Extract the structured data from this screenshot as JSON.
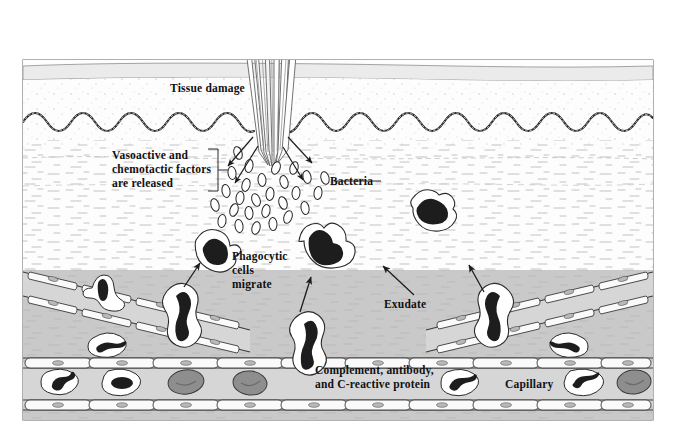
{
  "figure": {
    "width": 677,
    "height": 430,
    "background_color": "#ffffff",
    "border_color": "#6f6f6f"
  },
  "labels": {
    "tissue_damage": "Tissue damage",
    "vasoactive": "Vasoactive and\nchemotactic factors\nare released",
    "bacteria": "Bacteria",
    "phagocytic": "Phagocytic\ncells\nmigrate",
    "exudate": "Exudate",
    "complement": "Complement, antibody,\nand C-reactive protein",
    "capillary": "Capillary"
  },
  "layers": {
    "epidermis_surface": {
      "name": "epidermis-surface-band",
      "fill": "#ebebeb",
      "stroke": "#8a8a8a"
    },
    "epidermis_body": {
      "name": "epidermis-body",
      "fill": "#fdfdfd",
      "stipple_color": "#c8c8c8"
    },
    "basal_layer": {
      "name": "basal-cell-wavy-layer",
      "stroke": "#2a2a2a",
      "waves": 13
    },
    "dermis": {
      "name": "dermis-tissue",
      "fill": "#fbfbfb",
      "dash_color": "#bdbdbd"
    },
    "exudate_field": {
      "name": "exudate-field",
      "fill": "#c9c9c9"
    },
    "capillary_lumen": {
      "name": "capillary-lumen",
      "fill": "#d4d4d4",
      "wall_fill": "#f7f7f7",
      "wall_stroke": "#3a3a3a"
    }
  },
  "cells": {
    "bacteria": {
      "name": "bacteria-ellipse",
      "count": 27,
      "fill": "#ffffff",
      "stroke": "#2a2a2a"
    },
    "phagocyte": {
      "name": "phagocytic-cell",
      "cytoplasm_fill": "#ffffff",
      "nucleus_fill": "#1d1d1d",
      "stroke": "#2a2a2a",
      "count_migrating": 6
    },
    "white_blood_cell": {
      "name": "white-blood-cell",
      "fill": "#ffffff",
      "nucleus_fill": "#1d1d1d",
      "count": 5
    },
    "red_blood_cell": {
      "name": "red-blood-cell",
      "fill": "#8e8e8e",
      "stroke": "#3a3a3a",
      "count": 4
    },
    "endothelial_cell": {
      "name": "endothelial-cell",
      "fill": "#fafafa",
      "nucleus_fill": "#b9b9b9",
      "stroke": "#3a3a3a"
    },
    "splinter": {
      "name": "splinter-thorn",
      "fill": "#ffffff",
      "stroke": "#5a5a5a"
    }
  },
  "annotations": {
    "bracket": {
      "name": "vasoactive-bracket",
      "stroke": "#3a3a3a"
    },
    "leader_line": {
      "name": "bacteria-leader-line",
      "stroke": "#3a3a3a"
    },
    "arrows": {
      "name": "migration-arrow",
      "stroke": "#2a2a2a",
      "count": 9
    }
  }
}
